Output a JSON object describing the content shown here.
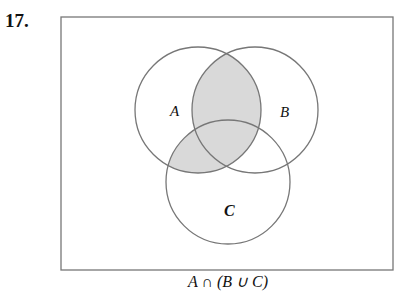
{
  "problem_number": "17.",
  "diagram": {
    "type": "venn",
    "sets": [
      {
        "label": "A",
        "cx": 198,
        "cy": 110,
        "r": 63,
        "label_x": 170,
        "label_y": 116
      },
      {
        "label": "B",
        "cx": 255,
        "cy": 110,
        "r": 63,
        "label_x": 286,
        "label_y": 117
      },
      {
        "label": "C",
        "cx": 228,
        "cy": 182,
        "r": 62,
        "label_x": 229,
        "label_y": 215
      }
    ],
    "shaded_region": "A ∩ (B ∪ C)",
    "shade_color": "#d9d9d9",
    "stroke_color": "#777777",
    "frame": {
      "x": 61,
      "y": 17,
      "width": 332,
      "height": 253
    }
  },
  "caption": "A ∩ (B ∪ C)"
}
